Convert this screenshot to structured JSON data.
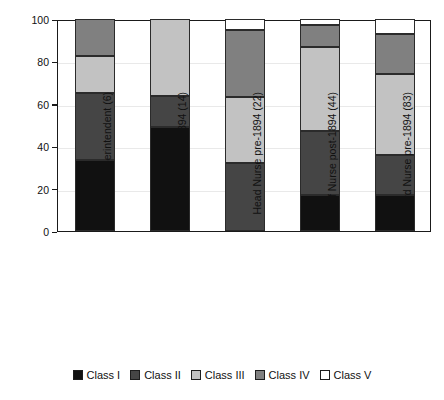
{
  "chart_data": {
    "type": "bar",
    "stacked": true,
    "title": "",
    "xlabel": "",
    "ylabel": "Percentage",
    "ylim": [
      0,
      100
    ],
    "yticks": [
      0,
      20,
      40,
      60,
      80,
      100
    ],
    "grid": true,
    "legend_position": "bottom",
    "categories": [
      "Superintendent (6)",
      "Sister post-1894 (14)",
      "Head Nurse pre-1894 (22)",
      "Staff Nurse post-1894 (44)",
      "Ward Nurse pre-1894 (83)"
    ],
    "series": [
      {
        "name": "Class I",
        "color": "#111111",
        "values": [
          33.5,
          49.0,
          0.0,
          17.0,
          17.0
        ]
      },
      {
        "name": "Class II",
        "color": "#454545",
        "values": [
          31.5,
          14.5,
          32.0,
          30.0,
          19.0
        ]
      },
      {
        "name": "Class III",
        "color": "#c2c2c2",
        "values": [
          17.5,
          36.5,
          31.0,
          40.0,
          38.0
        ]
      },
      {
        "name": "Class IV",
        "color": "#808080",
        "values": [
          17.5,
          0.0,
          32.0,
          10.0,
          19.0
        ]
      },
      {
        "name": "Class V",
        "color": "#ffffff",
        "values": [
          0.0,
          0.0,
          5.0,
          3.0,
          7.0
        ]
      }
    ]
  },
  "legend": {
    "items": [
      {
        "label": "Class I"
      },
      {
        "label": "Class II"
      },
      {
        "label": "Class III"
      },
      {
        "label": "Class IV"
      },
      {
        "label": "Class V"
      }
    ]
  }
}
